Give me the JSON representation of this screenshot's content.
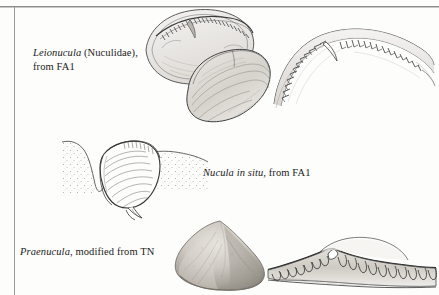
{
  "plate": {
    "width": 439,
    "height": 295,
    "background_color": "#fdfdfc",
    "ink_color": "#1b1b1b",
    "rule_color": "#8d8d8d",
    "description": "Scanned book-page figure plate of nuculid bivalve shells, hinge dentition details, and a life-position sketch"
  },
  "captions": {
    "leionucula": {
      "genus": "Leionucula",
      "rest_line1": " (Nuculidae),",
      "line2": "from FA1"
    },
    "nucula": {
      "italic": "Nucula in situ",
      "rest": ", from FA1"
    },
    "praenucula": {
      "genus": "Praenucula",
      "rest": ", modified from TN"
    }
  },
  "figures": [
    {
      "id": "leionucula-valves",
      "label": "leionucula-valves-drawing",
      "content": "pen-and-ink drawing of two nuculid valves, one interior view showing taxodont hinge teeth and one exterior view"
    },
    {
      "id": "leionucula-hinge",
      "label": "leionucula-hinge-detail-drawing",
      "content": "enlarged arched hinge line with a row of chevron taxodont teeth"
    },
    {
      "id": "nucula-in-situ",
      "label": "nucula-in-situ-drawing",
      "content": "bivalve in life position burrowed in stippled sediment with foot extended and a trace trail"
    },
    {
      "id": "praenucula-shell",
      "label": "praenucula-shell-photograph",
      "content": "toned photographic image of a rounded triangular praenuculid shell exterior"
    },
    {
      "id": "praenucula-hinge",
      "label": "praenucula-hinge-detail-drawing",
      "content": "chevron-shaped hinge plate bearing two rows of taxodont teeth"
    }
  ]
}
